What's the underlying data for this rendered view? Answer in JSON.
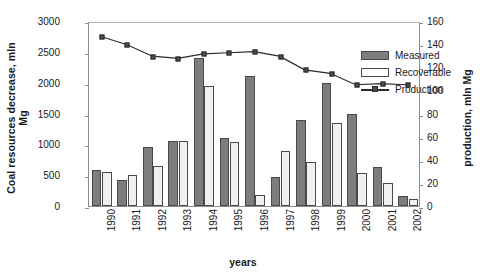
{
  "chart_data": {
    "type": "bar",
    "title": "",
    "xlabel": "years",
    "ylabel": "Coal resources decrease, mln Mg",
    "ylabel_secondary": "production, mln Mg",
    "categories": [
      "1990",
      "1991",
      "1992",
      "1993",
      "1994",
      "1995",
      "1996",
      "1997",
      "1998",
      "1999",
      "2000",
      "2001",
      "2002"
    ],
    "ylim": [
      0,
      3000
    ],
    "yticks": [
      0,
      500,
      1000,
      1500,
      2000,
      2500,
      3000
    ],
    "ylim_secondary": [
      0,
      160
    ],
    "yticks_secondary": [
      0,
      20,
      40,
      60,
      80,
      100,
      120,
      140,
      160
    ],
    "grid": false,
    "legend_position": "top-right",
    "series": [
      {
        "name": "Measured",
        "type": "bar",
        "axis": "left",
        "color": "#7d7d7d",
        "values": [
          590,
          425,
          960,
          1055,
          2400,
          1110,
          2105,
          470,
          1400,
          2000,
          1500,
          640,
          160
        ]
      },
      {
        "name": "Recoverable",
        "type": "bar",
        "axis": "left",
        "color": "#f0f0f0",
        "values": [
          555,
          510,
          650,
          1055,
          1950,
          1045,
          175,
          900,
          720,
          1345,
          540,
          375,
          120
        ]
      },
      {
        "name": "Production",
        "type": "line",
        "axis": "right",
        "color": "#2b2b2b",
        "values": [
          148,
          141,
          131,
          129,
          133,
          134,
          135,
          131,
          119,
          116,
          106,
          107,
          106
        ]
      }
    ]
  },
  "legend": {
    "items": [
      {
        "label": "Measured",
        "key": "measured"
      },
      {
        "label": "Recoverable",
        "key": "recoverable"
      },
      {
        "label": "Production",
        "key": "line"
      }
    ]
  },
  "axes": {
    "left_title_line1": "Coal resources decrease, mln",
    "left_title_line2": "Mg",
    "right_title": "production, mln Mg",
    "x_title": "years"
  }
}
